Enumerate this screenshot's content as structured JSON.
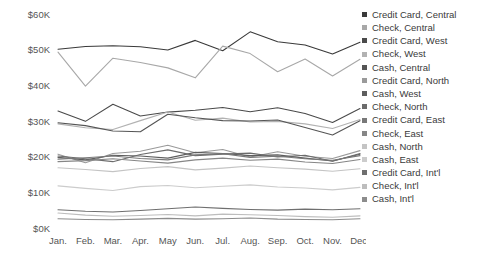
{
  "chart_data": {
    "type": "line",
    "title": "",
    "xlabel": "",
    "ylabel": "",
    "grid": false,
    "legend_position": "right",
    "categories": [
      "Jan.",
      "Feb.",
      "Mar.",
      "Apr.",
      "May",
      "Jun.",
      "Jul.",
      "Aug.",
      "Sep.",
      "Oct.",
      "Nov.",
      "Dec."
    ],
    "ylim": [
      0,
      60000
    ],
    "ytick_values": [
      0,
      10000,
      20000,
      30000,
      40000,
      50000,
      60000
    ],
    "ytick_labels": [
      "$0K",
      "$10K",
      "$20K",
      "$30K",
      "$40K",
      "$50K",
      "$60K"
    ],
    "series": [
      {
        "name": "Credit Card, Central",
        "color": "#3a3a3a",
        "values": [
          50100,
          50900,
          51100,
          50800,
          49900,
          52600,
          49700,
          55000,
          52200,
          51300,
          48800,
          52100
        ]
      },
      {
        "name": "Check, Central",
        "color": "#a8a8a8",
        "values": [
          49300,
          39800,
          47600,
          46400,
          44900,
          42100,
          51000,
          48900,
          43800,
          47400,
          42600,
          47300
        ]
      },
      {
        "name": "Credit Card, West",
        "color": "#4a4a4a",
        "values": [
          32800,
          29900,
          34700,
          31400,
          32500,
          33000,
          33800,
          32600,
          33700,
          32100,
          29600,
          33500
        ]
      },
      {
        "name": "Check, West",
        "color": "#b2b2b2",
        "values": [
          29200,
          28100,
          27600,
          30100,
          32500,
          30200,
          30800,
          29700,
          29900,
          29200,
          27900,
          30400
        ]
      },
      {
        "name": "Cash, Central",
        "color": "#555555",
        "values": [
          29500,
          28700,
          27200,
          27000,
          31900,
          30900,
          30100,
          30000,
          30300,
          28200,
          26100,
          30100
        ]
      },
      {
        "name": "Credit Card, North",
        "color": "#9a9a9a",
        "values": [
          20700,
          18300,
          20900,
          21500,
          23200,
          21100,
          22000,
          19900,
          21400,
          20100,
          19500,
          21700
        ]
      },
      {
        "name": "Cash, West",
        "color": "#5e5e5e",
        "values": [
          19800,
          19100,
          20400,
          20200,
          19600,
          21200,
          20900,
          20300,
          20500,
          19600,
          18800,
          20700
        ]
      },
      {
        "name": "Check, North",
        "color": "#6b6b6b",
        "values": [
          20200,
          19400,
          18600,
          20600,
          21900,
          20300,
          20700,
          21000,
          19900,
          20400,
          18700,
          20900
        ]
      },
      {
        "name": "Credit Card, East",
        "color": "#787878",
        "values": [
          19300,
          19700,
          20200,
          19500,
          19100,
          20500,
          20800,
          19800,
          20100,
          19400,
          19000,
          20300
        ]
      },
      {
        "name": "Check, East",
        "color": "#868686",
        "values": [
          18600,
          18900,
          19400,
          18800,
          18200,
          19100,
          19600,
          19000,
          19300,
          18500,
          18100,
          19200
        ]
      },
      {
        "name": "Cash, North",
        "color": "#c4c4c4",
        "values": [
          16900,
          16400,
          15800,
          16700,
          17200,
          16300,
          16800,
          17400,
          16900,
          16500,
          15900,
          16600
        ]
      },
      {
        "name": "Cash, East",
        "color": "#cccccc",
        "values": [
          11800,
          11100,
          10500,
          11600,
          11900,
          11300,
          11700,
          12100,
          11500,
          11200,
          10700,
          11400
        ]
      },
      {
        "name": "Credit Card, Int'l",
        "color": "#6f6f6f",
        "values": [
          5100,
          4700,
          4500,
          4900,
          5400,
          5900,
          5500,
          5200,
          5000,
          5300,
          5100,
          5400
        ]
      },
      {
        "name": "Check, Int'l",
        "color": "#bdbdbd",
        "values": [
          4200,
          3600,
          3300,
          3500,
          3800,
          3400,
          3900,
          3700,
          3500,
          3200,
          3000,
          3400
        ]
      },
      {
        "name": "Cash, Int'l",
        "color": "#8c8c8c",
        "values": [
          2600,
          2400,
          2300,
          2500,
          2700,
          2500,
          2600,
          2800,
          2500,
          2400,
          2300,
          2600
        ]
      }
    ]
  },
  "legend": {
    "items": [
      {
        "label": "Credit Card, Central",
        "color": "#3a3a3a"
      },
      {
        "label": "Check, Central",
        "color": "#a8a8a8"
      },
      {
        "label": "Credit Card, West",
        "color": "#4a4a4a"
      },
      {
        "label": "Check, West",
        "color": "#b2b2b2"
      },
      {
        "label": "Cash, Central",
        "color": "#555555"
      },
      {
        "label": "Credit Card, North",
        "color": "#9a9a9a"
      },
      {
        "label": "Cash, West",
        "color": "#5e5e5e"
      },
      {
        "label": "Check, North",
        "color": "#6b6b6b"
      },
      {
        "label": "Credit Card, East",
        "color": "#787878"
      },
      {
        "label": "Check, East",
        "color": "#868686"
      },
      {
        "label": "Cash, North",
        "color": "#c4c4c4"
      },
      {
        "label": "Cash, East",
        "color": "#cccccc"
      },
      {
        "label": "Credit Card, Int'l",
        "color": "#6f6f6f"
      },
      {
        "label": "Check, Int'l",
        "color": "#bdbdbd"
      },
      {
        "label": "Cash, Int'l",
        "color": "#8c8c8c"
      }
    ]
  }
}
